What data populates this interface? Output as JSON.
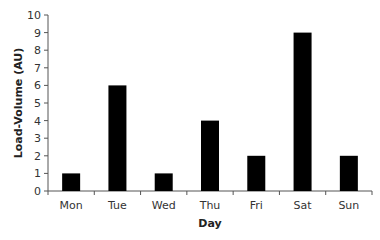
{
  "chart_data": {
    "type": "bar",
    "title": "",
    "xlabel": "Day",
    "ylabel": "Load-Volume (AU)",
    "categories": [
      "Mon",
      "Tue",
      "Wed",
      "Thu",
      "Fri",
      "Sat",
      "Sun"
    ],
    "values": [
      1,
      6,
      1,
      4,
      2,
      9,
      2
    ],
    "ylim": [
      0,
      10
    ],
    "yticks": [
      0,
      1,
      2,
      3,
      4,
      5,
      6,
      7,
      8,
      9,
      10
    ],
    "grid": false,
    "legend": null,
    "bar_color": "#000000"
  }
}
